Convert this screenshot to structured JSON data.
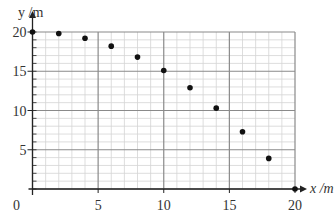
{
  "chart_data": {
    "type": "scatter",
    "title": "",
    "xlabel": "x /m",
    "ylabel": "y /m",
    "xlim": [
      0,
      20
    ],
    "ylim": [
      0,
      20
    ],
    "x_ticks": [
      0,
      5,
      10,
      15,
      20
    ],
    "y_ticks": [
      5,
      10,
      15,
      20
    ],
    "x_tick_labels": [
      "0",
      "5",
      "10",
      "15",
      "20"
    ],
    "y_tick_labels": [
      "5",
      "10",
      "15",
      "20"
    ],
    "grid": {
      "major_step": 5,
      "minor_step": 1,
      "on": true
    },
    "legend": null,
    "series": [
      {
        "name": "trajectory",
        "x": [
          0,
          2,
          4,
          6,
          8,
          10,
          12,
          14,
          16,
          18,
          20
        ],
        "y": [
          20,
          19.8,
          19.2,
          18.2,
          16.8,
          15.1,
          12.9,
          10.3,
          7.3,
          3.9,
          0
        ]
      }
    ]
  },
  "colors": {
    "major_grid": "#8a8a8a",
    "minor_grid": "#d4d4d4",
    "axis": "#222222",
    "point": "#111111",
    "text": "#333333"
  }
}
